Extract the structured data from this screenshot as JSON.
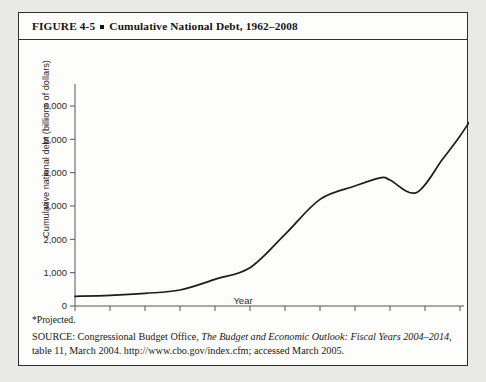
{
  "figure": {
    "label": "FIGURE 4-5",
    "title": "Cumulative National Debt, 1962–2008",
    "projected_note": "*Projected.",
    "source_prefix": "SOURCE: Congressional Budget Office, ",
    "source_italic_1": "The Budget and Economic Outlook: Fiscal Years 2004–2014",
    "source_suffix": ", table 11, March 2004. http://www.cbo.gov/index.cfm; accessed March 2005."
  },
  "chart_data": {
    "type": "line",
    "title": "Cumulative National Debt, 1962–2008",
    "xlabel": "Year",
    "ylabel": "Cumulative national debt (billions of dollars)",
    "xlim": [
      1962,
      2008
    ],
    "ylim": [
      0,
      6500
    ],
    "ytick_values": [
      0,
      1000,
      2000,
      3000,
      4000,
      5000,
      6000
    ],
    "ytick_labels": [
      "0",
      "1,000",
      "2,000",
      "3,000",
      "4,000",
      "5,000",
      "6,000"
    ],
    "xtick_values": [
      1962,
      1966,
      1970,
      1974,
      1978,
      1982,
      1986,
      1990,
      1994,
      1998,
      2002,
      2006
    ],
    "xtick_labels": [
      "1962",
      "1966",
      "1970",
      "1974",
      "1978",
      "1982",
      "1986",
      "1990",
      "1994",
      "1998",
      "2002",
      "2006*"
    ],
    "grid": false,
    "legend": "none",
    "line_color": "#1c1c1c",
    "series": [
      {
        "name": "Cumulative national debt",
        "x": [
          1962,
          1966,
          1970,
          1974,
          1978,
          1980,
          1982,
          1984,
          1986,
          1988,
          1990,
          1992,
          1994,
          1996,
          1997,
          1998,
          2000,
          2001,
          2002,
          2004,
          2006,
          2008
        ],
        "values": [
          290,
          320,
          380,
          480,
          780,
          930,
          1150,
          1600,
          2130,
          2600,
          3200,
          4060,
          4650,
          5200,
          5400,
          5500,
          5650,
          5800,
          6200,
          7400,
          8500,
          9400
        ]
      }
    ],
    "plotted_points": [
      {
        "year": 1962,
        "value": 290
      },
      {
        "year": 1966,
        "value": 320
      },
      {
        "year": 1970,
        "value": 380
      },
      {
        "year": 1974,
        "value": 480
      },
      {
        "year": 1978,
        "value": 800
      },
      {
        "year": 1982,
        "value": 1150
      },
      {
        "year": 1986,
        "value": 2150
      },
      {
        "year": 1990,
        "value": 3200
      },
      {
        "year": 1994,
        "value": 3600
      },
      {
        "year": 1997,
        "value": 3850
      },
      {
        "year": 1998,
        "value": 3780
      },
      {
        "year": 2001,
        "value": 3400
      },
      {
        "year": 2004,
        "value": 4400
      },
      {
        "year": 2006,
        "value": 5100
      },
      {
        "year": 2008,
        "value": 5900
      }
    ]
  }
}
